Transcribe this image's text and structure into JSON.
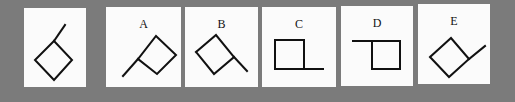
{
  "colors": {
    "background": "#7b7b7b",
    "panel": "#fbfbfb",
    "stroke": "#111111"
  },
  "question_figure": {
    "label": "",
    "description": "rotated square (diamond) with a line extending up-right from its left corner"
  },
  "options": [
    {
      "label": "A",
      "description": "rotated square with a line extending down-left from its left corner"
    },
    {
      "label": "B",
      "description": "rotated square with a line extending down-right from its right corner"
    },
    {
      "label": "C",
      "description": "upright square with a horizontal line extending right from its bottom-right corner"
    },
    {
      "label": "D",
      "description": "upright square with a horizontal line extending left from its top-left corner"
    },
    {
      "label": "E",
      "description": "rotated square with a line extending up-right from its right corner"
    }
  ]
}
